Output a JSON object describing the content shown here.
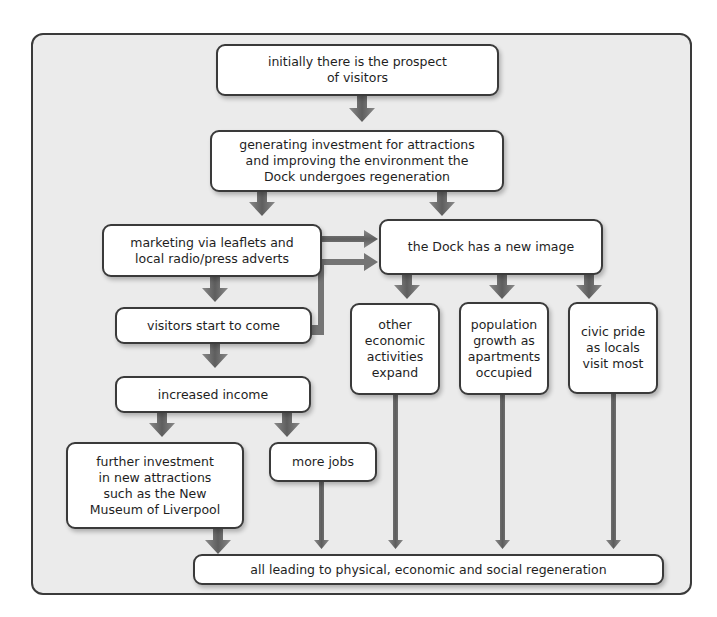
{
  "diagram": {
    "type": "flowchart",
    "nodes": {
      "n1": "initially there is the prospect\nof visitors",
      "n2": "generating investment for attractions\nand improving the environment the\nDock undergoes regeneration",
      "n3": "marketing via leaflets and\nlocal radio/press adverts",
      "n4": "the Dock has a new image",
      "n5": "visitors start to come",
      "n6": "other\neconomic\nactivities\nexpand",
      "n7": "population\ngrowth as\napartments\noccupied",
      "n8": "civic pride\nas locals\nvisit most",
      "n9": "increased income",
      "n10": "further investment\nin new attractions\nsuch as the New\nMuseum of Liverpool",
      "n11": "more jobs",
      "n12": "all leading to physical, economic and social regeneration"
    },
    "edges": [
      [
        "n1",
        "n2"
      ],
      [
        "n2",
        "n3"
      ],
      [
        "n2",
        "n4"
      ],
      [
        "n3",
        "n4"
      ],
      [
        "n3",
        "n5"
      ],
      [
        "n5",
        "n4"
      ],
      [
        "n4",
        "n6"
      ],
      [
        "n4",
        "n7"
      ],
      [
        "n4",
        "n8"
      ],
      [
        "n5",
        "n9"
      ],
      [
        "n9",
        "n10"
      ],
      [
        "n9",
        "n11"
      ],
      [
        "n10",
        "n12"
      ],
      [
        "n11",
        "n12"
      ],
      [
        "n6",
        "n12"
      ],
      [
        "n7",
        "n12"
      ],
      [
        "n8",
        "n12"
      ]
    ],
    "colors": {
      "background": "#ebebeb",
      "border": "#3a3a3a",
      "arrow": "#6b6b6b",
      "box": "#ffffff"
    }
  }
}
